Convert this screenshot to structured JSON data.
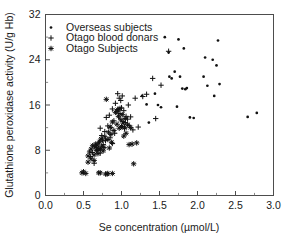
{
  "chart_data": {
    "type": "scatter",
    "title": "",
    "xlabel": "Se concentration (µmol/L)",
    "ylabel": "Glutathione peroxidase activity (U/g Hb)",
    "xlim": [
      0.0,
      3.0
    ],
    "ylim": [
      0,
      32
    ],
    "xticks": [
      "0.0",
      "0.5",
      "1.0",
      "1.5",
      "2.0",
      "2.5",
      "3.0"
    ],
    "xtick_values": [
      0.0,
      0.5,
      1.0,
      1.5,
      2.0,
      2.5,
      3.0
    ],
    "yticks": [
      "0",
      "8",
      "16",
      "24",
      "32"
    ],
    "ytick_values": [
      0,
      8,
      16,
      24,
      32
    ],
    "x_minor_step": 0.25,
    "y_minor_step": 4,
    "grid": false,
    "legend_position": "top-left",
    "legend": [
      {
        "label": "Overseas subjects",
        "marker": "dot"
      },
      {
        "label": "Otago blood donars",
        "marker": "plus"
      },
      {
        "label": "Otago Subjects",
        "marker": "star"
      }
    ],
    "series": [
      {
        "name": "Overseas subjects",
        "marker": "dot",
        "points": [
          [
            1.57,
            28.0
          ],
          [
            1.62,
            25.3
          ],
          [
            1.63,
            21.0
          ],
          [
            1.66,
            20.7
          ],
          [
            1.7,
            21.9
          ],
          [
            1.73,
            15.7
          ],
          [
            1.75,
            27.6
          ],
          [
            1.77,
            21.0
          ],
          [
            1.8,
            18.9
          ],
          [
            1.82,
            26.0
          ],
          [
            1.84,
            18.8
          ],
          [
            1.86,
            19.0
          ],
          [
            1.9,
            13.8
          ],
          [
            1.95,
            13.7
          ],
          [
            2.08,
            21.0
          ],
          [
            2.1,
            24.4
          ],
          [
            2.13,
            19.4
          ],
          [
            2.2,
            24.0
          ],
          [
            2.22,
            17.6
          ],
          [
            2.25,
            23.0
          ],
          [
            2.27,
            27.4
          ],
          [
            2.29,
            19.7
          ],
          [
            2.66,
            13.9
          ],
          [
            2.78,
            14.6
          ],
          [
            1.33,
            16.1
          ],
          [
            1.44,
            18.0
          ],
          [
            1.36,
            12.9
          ],
          [
            1.27,
            17.6
          ],
          [
            1.48,
            16.0
          ],
          [
            1.52,
            15.6
          ]
        ]
      },
      {
        "name": "Otago blood donars",
        "marker": "plus",
        "points": [
          [
            0.59,
            6.9
          ],
          [
            0.62,
            7.6
          ],
          [
            0.64,
            5.7
          ],
          [
            0.67,
            8.4
          ],
          [
            0.7,
            9.3
          ],
          [
            0.72,
            7.5
          ],
          [
            0.74,
            10.6
          ],
          [
            0.76,
            9.0
          ],
          [
            0.78,
            11.3
          ],
          [
            0.8,
            13.8
          ],
          [
            0.82,
            12.3
          ],
          [
            0.84,
            14.2
          ],
          [
            0.86,
            12.0
          ],
          [
            0.88,
            15.3
          ],
          [
            0.9,
            13.2
          ],
          [
            0.92,
            16.3
          ],
          [
            0.94,
            14.9
          ],
          [
            0.95,
            18.0
          ],
          [
            0.96,
            15.1
          ],
          [
            0.97,
            17.2
          ],
          [
            0.98,
            14.5
          ],
          [
            0.99,
            16.8
          ],
          [
            1.0,
            15.5
          ],
          [
            1.01,
            17.6
          ],
          [
            1.02,
            13.1
          ],
          [
            1.03,
            15.0
          ],
          [
            1.05,
            12.9
          ],
          [
            1.06,
            14.0
          ],
          [
            1.08,
            13.5
          ],
          [
            1.1,
            12.4
          ],
          [
            1.12,
            13.9
          ],
          [
            1.15,
            11.6
          ],
          [
            1.18,
            17.2
          ],
          [
            1.22,
            12.1
          ],
          [
            1.28,
            17.5
          ],
          [
            1.33,
            17.9
          ],
          [
            1.41,
            20.7
          ],
          [
            1.45,
            13.6
          ],
          [
            1.52,
            19.5
          ],
          [
            1.62,
            25.5
          ],
          [
            0.72,
            11.9
          ],
          [
            0.85,
            10.2
          ],
          [
            0.91,
            11.0
          ],
          [
            1.04,
            11.8
          ],
          [
            0.68,
            8.0
          ],
          [
            0.79,
            9.7
          ],
          [
            0.88,
            9.2
          ],
          [
            1.09,
            16.0
          ]
        ]
      },
      {
        "name": "Otago Subjects",
        "marker": "star",
        "points": [
          [
            0.48,
            4.0
          ],
          [
            0.5,
            4.2
          ],
          [
            0.53,
            3.9
          ],
          [
            0.56,
            5.9
          ],
          [
            0.58,
            7.7
          ],
          [
            0.6,
            8.2
          ],
          [
            0.62,
            8.8
          ],
          [
            0.64,
            7.2
          ],
          [
            0.65,
            8.6
          ],
          [
            0.66,
            9.1
          ],
          [
            0.67,
            8.0
          ],
          [
            0.68,
            8.9
          ],
          [
            0.69,
            7.4
          ],
          [
            0.7,
            8.3
          ],
          [
            0.71,
            9.5
          ],
          [
            0.72,
            8.1
          ],
          [
            0.73,
            10.0
          ],
          [
            0.74,
            8.7
          ],
          [
            0.75,
            9.8
          ],
          [
            0.76,
            7.9
          ],
          [
            0.77,
            8.5
          ],
          [
            0.78,
            10.4
          ],
          [
            0.79,
            3.8
          ],
          [
            0.8,
            17.0
          ],
          [
            0.81,
            3.8
          ],
          [
            0.82,
            9.9
          ],
          [
            0.83,
            11.2
          ],
          [
            0.84,
            8.4
          ],
          [
            0.85,
            12.1
          ],
          [
            0.86,
            10.8
          ],
          [
            0.87,
            9.4
          ],
          [
            0.88,
            13.0
          ],
          [
            0.9,
            11.5
          ],
          [
            0.92,
            14.7
          ],
          [
            0.94,
            12.6
          ],
          [
            0.95,
            15.2
          ],
          [
            0.96,
            14.0
          ],
          [
            0.97,
            11.9
          ],
          [
            0.98,
            15.4
          ],
          [
            0.99,
            13.4
          ],
          [
            1.0,
            12.2
          ],
          [
            1.01,
            14.3
          ],
          [
            1.02,
            12.8
          ],
          [
            1.03,
            10.5
          ],
          [
            1.04,
            12.0
          ],
          [
            1.05,
            13.6
          ],
          [
            1.06,
            11.0
          ],
          [
            1.08,
            12.5
          ],
          [
            1.1,
            9.0
          ],
          [
            1.12,
            12.0
          ],
          [
            1.14,
            9.1
          ],
          [
            1.16,
            5.6
          ],
          [
            1.2,
            9.3
          ],
          [
            0.7,
            4.0
          ],
          [
            0.72,
            4.0
          ],
          [
            0.82,
            3.9
          ],
          [
            0.88,
            3.9
          ],
          [
            0.64,
            6.2
          ],
          [
            0.6,
            6.5
          ],
          [
            0.56,
            7.0
          ]
        ]
      }
    ]
  },
  "axes": {
    "x_title": "Se concentration (µmol/L)",
    "y_title": "Glutathione peroxidase activity (U/g Hb)"
  }
}
